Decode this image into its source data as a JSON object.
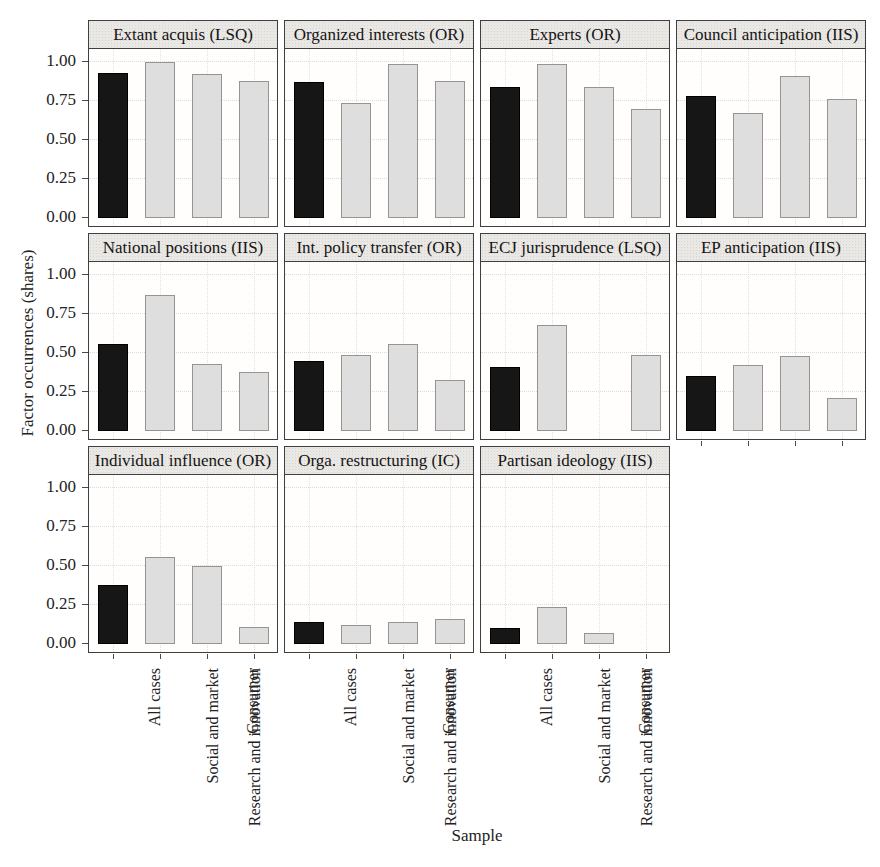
{
  "figure": {
    "ylabel": "Factor occurrences (shares)",
    "xlabel": "Sample"
  },
  "chart_data": {
    "type": "bar",
    "title": "",
    "ylabel": "Factor occurrences (shares)",
    "xlabel": "Sample",
    "ylim": [
      0,
      1.08
    ],
    "yticks": [
      0.0,
      0.25,
      0.5,
      0.75,
      1.0
    ],
    "ytick_labels": [
      "0.00",
      "0.25",
      "0.50",
      "0.75",
      "1.00"
    ],
    "categories": [
      "All cases",
      "Social and market",
      "Research and innovation",
      "Consumer"
    ],
    "legend_position": "none",
    "grid": "dotted gridlines at y ticks and at bar centers",
    "layout": {
      "rows": 3,
      "cols": 4,
      "last_row_panels": 3
    },
    "bar_style": {
      "first_bar_color": "#1a1a1a",
      "other_bars_color": "#d9d9d9",
      "strip_background": "#eae8e5",
      "panel_border": "#3f3f3f"
    },
    "panels": [
      {
        "title": "Extant acquis (LSQ)",
        "values": [
          0.93,
          1.0,
          0.92,
          0.88
        ]
      },
      {
        "title": "Organized interests (OR)",
        "values": [
          0.87,
          0.74,
          0.99,
          0.88
        ]
      },
      {
        "title": "Experts (OR)",
        "values": [
          0.84,
          0.99,
          0.84,
          0.7
        ]
      },
      {
        "title": "Council anticipation (IIS)",
        "values": [
          0.78,
          0.67,
          0.91,
          0.76
        ]
      },
      {
        "title": "National positions (IIS)",
        "values": [
          0.56,
          0.87,
          0.43,
          0.38
        ]
      },
      {
        "title": "Int. policy transfer (OR)",
        "values": [
          0.45,
          0.49,
          0.56,
          0.33
        ]
      },
      {
        "title": "ECJ jurisprudence (LSQ)",
        "values": [
          0.41,
          0.68,
          0.0,
          0.49
        ]
      },
      {
        "title": "EP anticipation (IIS)",
        "values": [
          0.35,
          0.42,
          0.48,
          0.21
        ]
      },
      {
        "title": "Individual influence (OR)",
        "values": [
          0.38,
          0.56,
          0.5,
          0.11
        ]
      },
      {
        "title": "Orga. restructuring (IC)",
        "values": [
          0.14,
          0.12,
          0.14,
          0.16
        ]
      },
      {
        "title": "Partisan ideology (IIS)",
        "values": [
          0.1,
          0.24,
          0.07,
          0.0
        ]
      }
    ]
  }
}
